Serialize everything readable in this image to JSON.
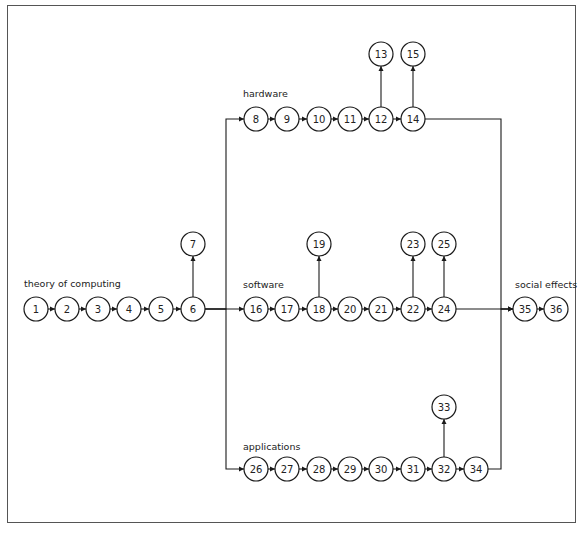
{
  "diagram": {
    "type": "flow-diagram",
    "groups": [
      {
        "id": "theory",
        "label": "theory of computing",
        "label_x": 24,
        "label_y": 287
      },
      {
        "id": "hardware",
        "label": "hardware",
        "label_x": 243,
        "label_y": 97
      },
      {
        "id": "software",
        "label": "software",
        "label_x": 243,
        "label_y": 288
      },
      {
        "id": "applications",
        "label": "applications",
        "label_x": 243,
        "label_y": 450
      },
      {
        "id": "social",
        "label": "social effects",
        "label_x": 515,
        "label_y": 288
      }
    ],
    "nodes": [
      {
        "id": "1",
        "x": 36,
        "y": 309
      },
      {
        "id": "2",
        "x": 67,
        "y": 309
      },
      {
        "id": "3",
        "x": 98,
        "y": 309
      },
      {
        "id": "4",
        "x": 129,
        "y": 309
      },
      {
        "id": "5",
        "x": 161,
        "y": 309
      },
      {
        "id": "6",
        "x": 193,
        "y": 309
      },
      {
        "id": "7",
        "x": 193,
        "y": 244
      },
      {
        "id": "8",
        "x": 256,
        "y": 119
      },
      {
        "id": "9",
        "x": 287,
        "y": 119
      },
      {
        "id": "10",
        "x": 319,
        "y": 119
      },
      {
        "id": "11",
        "x": 350,
        "y": 119
      },
      {
        "id": "12",
        "x": 381,
        "y": 119
      },
      {
        "id": "13",
        "x": 381,
        "y": 54
      },
      {
        "id": "14",
        "x": 413,
        "y": 119
      },
      {
        "id": "15",
        "x": 413,
        "y": 54
      },
      {
        "id": "16",
        "x": 256,
        "y": 309
      },
      {
        "id": "17",
        "x": 287,
        "y": 309
      },
      {
        "id": "18",
        "x": 319,
        "y": 309
      },
      {
        "id": "19",
        "x": 319,
        "y": 244
      },
      {
        "id": "20",
        "x": 350,
        "y": 309
      },
      {
        "id": "21",
        "x": 381,
        "y": 309
      },
      {
        "id": "22",
        "x": 413,
        "y": 309
      },
      {
        "id": "23",
        "x": 413,
        "y": 244
      },
      {
        "id": "24",
        "x": 444,
        "y": 309
      },
      {
        "id": "25",
        "x": 444,
        "y": 244
      },
      {
        "id": "26",
        "x": 256,
        "y": 469
      },
      {
        "id": "27",
        "x": 287,
        "y": 469
      },
      {
        "id": "28",
        "x": 319,
        "y": 469
      },
      {
        "id": "29",
        "x": 350,
        "y": 469
      },
      {
        "id": "30",
        "x": 381,
        "y": 469
      },
      {
        "id": "31",
        "x": 413,
        "y": 469
      },
      {
        "id": "32",
        "x": 444,
        "y": 469
      },
      {
        "id": "33",
        "x": 444,
        "y": 407
      },
      {
        "id": "34",
        "x": 476,
        "y": 469
      },
      {
        "id": "35",
        "x": 525,
        "y": 309
      },
      {
        "id": "36",
        "x": 556,
        "y": 309
      }
    ],
    "edges": [
      [
        "1",
        "2"
      ],
      [
        "2",
        "3"
      ],
      [
        "3",
        "4"
      ],
      [
        "4",
        "5"
      ],
      [
        "5",
        "6"
      ],
      [
        "6",
        "7"
      ],
      [
        "6",
        "8"
      ],
      [
        "6",
        "16"
      ],
      [
        "6",
        "26"
      ],
      [
        "8",
        "9"
      ],
      [
        "9",
        "10"
      ],
      [
        "10",
        "11"
      ],
      [
        "11",
        "12"
      ],
      [
        "12",
        "13"
      ],
      [
        "12",
        "14"
      ],
      [
        "14",
        "15"
      ],
      [
        "16",
        "17"
      ],
      [
        "17",
        "18"
      ],
      [
        "18",
        "19"
      ],
      [
        "18",
        "20"
      ],
      [
        "20",
        "21"
      ],
      [
        "21",
        "22"
      ],
      [
        "22",
        "23"
      ],
      [
        "22",
        "24"
      ],
      [
        "24",
        "25"
      ],
      [
        "26",
        "27"
      ],
      [
        "27",
        "28"
      ],
      [
        "28",
        "29"
      ],
      [
        "29",
        "30"
      ],
      [
        "30",
        "31"
      ],
      [
        "31",
        "32"
      ],
      [
        "32",
        "33"
      ],
      [
        "32",
        "34"
      ],
      [
        "14",
        "35"
      ],
      [
        "24",
        "35"
      ],
      [
        "34",
        "35"
      ],
      [
        "35",
        "36"
      ]
    ],
    "node_radius": 12,
    "stroke_color": "#1a1a1a",
    "frame_color": "#555555"
  }
}
